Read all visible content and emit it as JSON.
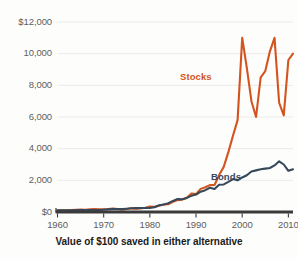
{
  "caption": "Value of $100 saved in either alternative",
  "colors": {
    "stocks": "#D4541F",
    "bonds": "#37485A",
    "gridline": "#ebebeb",
    "axis": "#3a3a3a",
    "tick_text": "#5d5d5d",
    "background": "#fdfdfc"
  },
  "axes": {
    "y_ticks": [
      "$0",
      "2,000",
      "4,000",
      "6,000",
      "8,000",
      "10,000",
      "$12,000"
    ],
    "x_ticks": [
      "1960",
      "1970",
      "1980",
      "1990",
      "2000",
      "2010"
    ]
  },
  "legend": {
    "stocks": "Stocks",
    "bonds": "Bonds"
  },
  "chart_data": {
    "type": "line",
    "title": "Value of $100 saved in either alternative",
    "xlabel": "",
    "ylabel": "",
    "xlim": [
      1960,
      2011
    ],
    "ylim": [
      0,
      12000
    ],
    "grid": true,
    "legend_position": "inline-annotation",
    "ytick_values": [
      0,
      2000,
      4000,
      6000,
      8000,
      10000,
      12000
    ],
    "ytick_labels": [
      "$0",
      "2,000",
      "4,000",
      "6,000",
      "8,000",
      "10,000",
      "$12,000"
    ],
    "xtick_values": [
      1960,
      1970,
      1980,
      1990,
      2000,
      2010
    ],
    "xtick_labels": [
      "1960",
      "1970",
      "1980",
      "1990",
      "2000",
      "2010"
    ],
    "x": [
      1960,
      1961,
      1962,
      1963,
      1964,
      1965,
      1966,
      1967,
      1968,
      1969,
      1970,
      1971,
      1972,
      1973,
      1974,
      1975,
      1976,
      1977,
      1978,
      1979,
      1980,
      1981,
      1982,
      1983,
      1984,
      1985,
      1986,
      1987,
      1988,
      1989,
      1990,
      1991,
      1992,
      1993,
      1994,
      1995,
      1996,
      1997,
      1998,
      1999,
      2000,
      2001,
      2002,
      2003,
      2004,
      2005,
      2006,
      2007,
      2008,
      2009,
      2010,
      2011
    ],
    "series": [
      {
        "name": "Stocks",
        "color": "#D4541F",
        "values": [
          100,
          112,
          102,
          124,
          142,
          156,
          138,
          168,
          184,
          166,
          170,
          192,
          226,
          192,
          140,
          190,
          232,
          214,
          226,
          264,
          346,
          326,
          390,
          470,
          492,
          640,
          750,
          780,
          900,
          1170,
          1130,
          1460,
          1560,
          1700,
          1710,
          2330,
          2850,
          3780,
          4820,
          5800,
          11000,
          9100,
          7000,
          6000,
          8500,
          8900,
          10150,
          11000,
          6900,
          6100,
          9600,
          10000
        ]
      },
      {
        "name": "Bonds",
        "color": "#37485A",
        "values": [
          100,
          104,
          110,
          113,
          118,
          120,
          124,
          122,
          128,
          124,
          142,
          164,
          180,
          182,
          186,
          210,
          240,
          246,
          250,
          250,
          262,
          300,
          430,
          470,
          560,
          700,
          820,
          810,
          890,
          1020,
          1100,
          1280,
          1380,
          1530,
          1450,
          1720,
          1740,
          1900,
          2080,
          2000,
          2180,
          2320,
          2560,
          2630,
          2700,
          2740,
          2780,
          2940,
          3200,
          3000,
          2600,
          2700
        ]
      }
    ],
    "annotations": [
      {
        "text": "Stocks",
        "x": 1994,
        "y": 9000,
        "color": "#D4541F"
      },
      {
        "text": "Bonds",
        "x": 1998,
        "y": 2900,
        "color": "#37485A"
      }
    ]
  }
}
